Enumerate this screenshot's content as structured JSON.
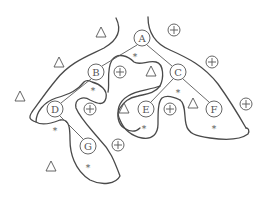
{
  "diagram": {
    "type": "tree-with-regions",
    "colors": {
      "stroke": "#4a4a4a",
      "text": "#555555",
      "background": "#ffffff"
    },
    "nodes": [
      {
        "id": "A",
        "label": "A",
        "x": 142,
        "y": 38
      },
      {
        "id": "B",
        "label": "B",
        "x": 96,
        "y": 72
      },
      {
        "id": "C",
        "label": "C",
        "x": 178,
        "y": 72
      },
      {
        "id": "D",
        "label": "D",
        "x": 55,
        "y": 109
      },
      {
        "id": "E",
        "label": "E",
        "x": 146,
        "y": 109
      },
      {
        "id": "F",
        "label": "F",
        "x": 214,
        "y": 109
      },
      {
        "id": "G",
        "label": "G",
        "x": 88,
        "y": 146
      }
    ],
    "edges": [
      [
        "A",
        "B"
      ],
      [
        "A",
        "C"
      ],
      [
        "B",
        "D"
      ],
      [
        "C",
        "E"
      ],
      [
        "C",
        "F"
      ],
      [
        "D",
        "G"
      ]
    ],
    "symbols": {
      "triangle_label": "△",
      "plus_label": "+",
      "star_label": "*",
      "triangles": [
        {
          "x": 101,
          "y": 32
        },
        {
          "x": 59,
          "y": 62
        },
        {
          "x": 20,
          "y": 96
        },
        {
          "x": 151,
          "y": 71
        },
        {
          "x": 124,
          "y": 108
        },
        {
          "x": 193,
          "y": 103
        },
        {
          "x": 51,
          "y": 166
        }
      ],
      "pluses": [
        {
          "x": 174,
          "y": 30
        },
        {
          "x": 212,
          "y": 62
        },
        {
          "x": 120,
          "y": 72
        },
        {
          "x": 246,
          "y": 104
        },
        {
          "x": 90,
          "y": 109
        },
        {
          "x": 170,
          "y": 109
        },
        {
          "x": 118,
          "y": 145
        }
      ],
      "stars": [
        {
          "x": 135,
          "y": 56
        },
        {
          "x": 93,
          "y": 90
        },
        {
          "x": 178,
          "y": 92
        },
        {
          "x": 55,
          "y": 130
        },
        {
          "x": 144,
          "y": 128
        },
        {
          "x": 214,
          "y": 128
        },
        {
          "x": 88,
          "y": 167
        }
      ]
    }
  }
}
